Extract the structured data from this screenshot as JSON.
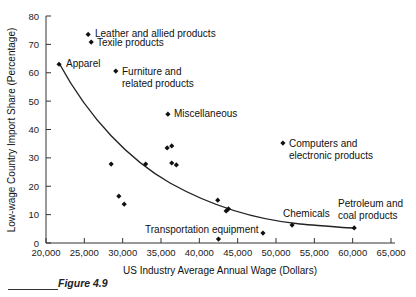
{
  "chart_data": {
    "type": "scatter",
    "title": "",
    "xlabel": "US Industry Average Annual Wage (Dollars)",
    "ylabel": "Low-wage Country Import Share (Percentage)",
    "xlim": [
      20000,
      65000
    ],
    "ylim": [
      0,
      80
    ],
    "x_ticks": [
      "20,000",
      "25,000",
      "30,000",
      "35,000",
      "40,000",
      "45,000",
      "50,000",
      "55,000",
      "60,000",
      "65,000"
    ],
    "y_ticks": [
      "0",
      "10",
      "20",
      "30",
      "40",
      "50",
      "60",
      "70",
      "80"
    ],
    "grid": false,
    "legend": null,
    "trendline": "decaying curve fitted through points",
    "points": [
      {
        "label": "Apparel",
        "x": 21700,
        "y": 63.0
      },
      {
        "label": "Leather and allied products",
        "x": 25500,
        "y": 73.5
      },
      {
        "label": "Texile products",
        "x": 25900,
        "y": 70.8
      },
      {
        "label": "Furniture and related products",
        "x": 29100,
        "y": 60.6
      },
      {
        "label": "Miscellaneous",
        "x": 35900,
        "y": 45.4
      },
      {
        "label": "Computers and electronic products",
        "x": 50900,
        "y": 35.2
      },
      {
        "label": "",
        "x": 35800,
        "y": 33.5
      },
      {
        "label": "",
        "x": 36400,
        "y": 34.2
      },
      {
        "label": "",
        "x": 28500,
        "y": 27.8
      },
      {
        "label": "",
        "x": 33000,
        "y": 27.8
      },
      {
        "label": "",
        "x": 36400,
        "y": 28.2
      },
      {
        "label": "",
        "x": 37000,
        "y": 27.5
      },
      {
        "label": "",
        "x": 29500,
        "y": 16.5
      },
      {
        "label": "",
        "x": 30200,
        "y": 13.7
      },
      {
        "label": "",
        "x": 42400,
        "y": 15.1
      },
      {
        "label": "",
        "x": 43500,
        "y": 11.3
      },
      {
        "label": "",
        "x": 43800,
        "y": 12.0
      },
      {
        "label": "Transportation equipment",
        "x": 42500,
        "y": 1.4
      },
      {
        "label": "",
        "x": 48300,
        "y": 3.5
      },
      {
        "label": "Chemicals",
        "x": 52100,
        "y": 6.3
      },
      {
        "label": "Petroleum and coal products",
        "x": 60200,
        "y": 5.3
      }
    ]
  },
  "labels": {
    "apparel": "Apparel",
    "leather": "Leather and allied products",
    "textile": "Texile products",
    "furniture_1": "Furniture and",
    "furniture_2": "related products",
    "misc": "Miscellaneous",
    "computers_1": "Computers and",
    "computers_2": "electronic products",
    "transport": "Transportation equipment",
    "chemicals": "Chemicals",
    "petroleum_1": "Petroleum and",
    "petroleum_2": "coal products"
  },
  "axes": {
    "xlabel": "US Industry Average Annual Wage (Dollars)",
    "ylabel": "Low-wage Country Import Share (Percentage)",
    "x_ticks": [
      "20,000",
      "25,000",
      "30,000",
      "35,000",
      "40,000",
      "45,000",
      "50,000",
      "55,000",
      "60,000",
      "65,000"
    ],
    "y_ticks": [
      "0",
      "10",
      "20",
      "30",
      "40",
      "50",
      "60",
      "70",
      "80"
    ]
  },
  "caption": "Figure 4.9"
}
